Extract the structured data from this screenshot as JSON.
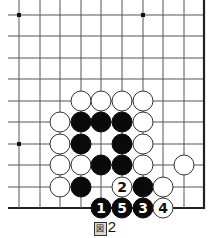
{
  "diagram": {
    "type": "go-board-fragment",
    "grid": {
      "cols_x": [
        19,
        40,
        60,
        81,
        101,
        122,
        143,
        163,
        184,
        204
      ],
      "rows_y": [
        15,
        36,
        58,
        79,
        101,
        122,
        144,
        165,
        187,
        208
      ],
      "left_extend_x": 8,
      "top_extend_y": 0,
      "right_edge": true,
      "bottom_edge": true,
      "line_color": "#555555",
      "edge_color": "#222222"
    },
    "star_points": [
      [
        0,
        0
      ],
      [
        6,
        0
      ],
      [
        0,
        6
      ]
    ],
    "stones": [
      {
        "col": 3,
        "row": 4,
        "color": "white"
      },
      {
        "col": 4,
        "row": 4,
        "color": "white"
      },
      {
        "col": 5,
        "row": 4,
        "color": "white"
      },
      {
        "col": 6,
        "row": 4,
        "color": "white"
      },
      {
        "col": 2,
        "row": 5,
        "color": "white"
      },
      {
        "col": 3,
        "row": 5,
        "color": "black"
      },
      {
        "col": 4,
        "row": 5,
        "color": "black"
      },
      {
        "col": 5,
        "row": 5,
        "color": "black"
      },
      {
        "col": 6,
        "row": 5,
        "color": "white"
      },
      {
        "col": 2,
        "row": 6,
        "color": "white"
      },
      {
        "col": 3,
        "row": 6,
        "color": "black"
      },
      {
        "col": 5,
        "row": 6,
        "color": "black"
      },
      {
        "col": 6,
        "row": 6,
        "color": "white"
      },
      {
        "col": 2,
        "row": 7,
        "color": "white"
      },
      {
        "col": 3,
        "row": 7,
        "color": "white"
      },
      {
        "col": 4,
        "row": 7,
        "color": "black"
      },
      {
        "col": 5,
        "row": 7,
        "color": "black"
      },
      {
        "col": 6,
        "row": 7,
        "color": "white"
      },
      {
        "col": 8,
        "row": 7,
        "color": "white"
      },
      {
        "col": 2,
        "row": 8,
        "color": "white"
      },
      {
        "col": 3,
        "row": 8,
        "color": "black"
      },
      {
        "col": 5,
        "row": 8,
        "color": "white",
        "label": "2"
      },
      {
        "col": 6,
        "row": 8,
        "color": "black"
      },
      {
        "col": 7,
        "row": 8,
        "color": "white"
      },
      {
        "col": 4,
        "row": 9,
        "color": "black",
        "label": "1"
      },
      {
        "col": 5,
        "row": 9,
        "color": "black",
        "label": "5"
      },
      {
        "col": 6,
        "row": 9,
        "color": "black",
        "label": "3"
      },
      {
        "col": 7,
        "row": 9,
        "color": "white",
        "label": "4"
      }
    ]
  },
  "caption": {
    "icon_glyph": "図",
    "number": "2"
  }
}
